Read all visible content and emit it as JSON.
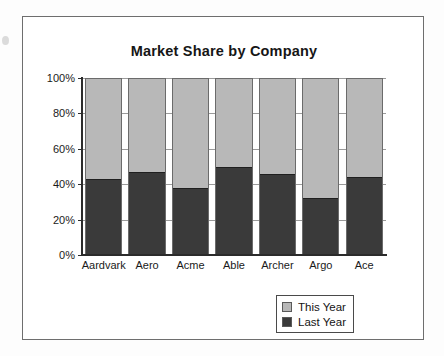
{
  "chart_data": {
    "type": "bar",
    "subtype": "stacked-percent",
    "title": "Market Share by Company",
    "xlabel": "",
    "ylabel": "",
    "ylim": [
      0,
      100
    ],
    "ytick_labels": [
      "0%",
      "20%",
      "40%",
      "60%",
      "80%",
      "100%"
    ],
    "ytick_values": [
      0,
      20,
      40,
      60,
      80,
      100
    ],
    "grid": true,
    "legend_position": "bottom-right",
    "categories": [
      "Aardvark",
      "Aero",
      "Acme",
      "Able",
      "Archer",
      "Argo",
      "Ace"
    ],
    "series": [
      {
        "name": "Last Year",
        "color": "#3a3a3a",
        "values": [
          43,
          47,
          38,
          50,
          46,
          32,
          44
        ]
      },
      {
        "name": "This Year",
        "color": "#b8b8b8",
        "values": [
          57,
          53,
          62,
          50,
          54,
          68,
          56
        ]
      }
    ]
  },
  "legend": {
    "items": [
      {
        "label": "This Year",
        "color": "#b8b8b8"
      },
      {
        "label": "Last Year",
        "color": "#3a3a3a"
      }
    ]
  },
  "colors": {
    "this_year": "#b8b8b8",
    "last_year": "#3a3a3a",
    "frame": "#6e6e6e",
    "axis": "#2b2b2b",
    "grid": "#9a9a9a",
    "background": "#ffffff"
  }
}
